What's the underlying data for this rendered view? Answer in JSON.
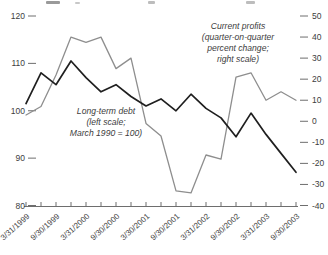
{
  "chart_data": {
    "type": "line",
    "x_tick_count": 19,
    "x_tick_labels_every_other": [
      "3/31/1999",
      "9/30/1999",
      "3/31/2000",
      "9/30/2000",
      "3/30/2001",
      "9/30/2001",
      "3/31/2002",
      "9/30/2002",
      "3/31/2003",
      "9/30/2003"
    ],
    "left_axis": {
      "range": [
        80,
        120
      ],
      "ticks": [
        120,
        110,
        100,
        90,
        80
      ]
    },
    "right_axis": {
      "range": [
        -40,
        50
      ],
      "ticks": [
        50,
        40,
        30,
        20,
        10,
        0,
        -10,
        -20,
        -30,
        -40
      ]
    },
    "grid": false,
    "legend_position": "inline-annotations",
    "series": [
      {
        "name": "Long-term debt",
        "axis": "left",
        "color": "#1f1f1f",
        "annotation": [
          "Long-term debt",
          "(left scale;",
          "March 1990 = 100)"
        ],
        "values": [
          101.5,
          108,
          105.5,
          110.5,
          107,
          104,
          105.5,
          103,
          101,
          102.5,
          100,
          103.5,
          100.5,
          98.5,
          94.5,
          99.5,
          95,
          91,
          87
        ]
      },
      {
        "name": "Current profits",
        "axis": "right",
        "color": "#8e8e8e",
        "annotation": [
          "Current profits",
          "(quarter-on-quarter",
          "percent change;",
          "right scale)"
        ],
        "values": [
          3,
          7,
          22,
          40,
          37.5,
          40,
          25,
          30,
          -1,
          -7,
          -33,
          -34,
          -16,
          -18,
          21,
          23,
          10,
          14,
          10
        ]
      }
    ],
    "title": "",
    "xlabel": "",
    "ylabel_left": "",
    "ylabel_right": ""
  }
}
